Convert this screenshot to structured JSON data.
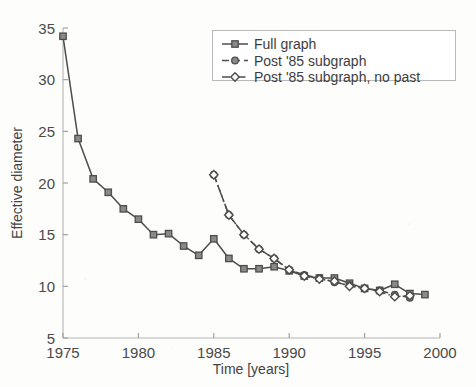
{
  "chart_data": {
    "type": "line",
    "title": "",
    "xlabel": "Time [years]",
    "ylabel": "Effective diameter",
    "xlim": [
      1975,
      2000
    ],
    "ylim": [
      5,
      35
    ],
    "xticks": [
      "1975",
      "1980",
      "1985",
      "1990",
      "1995",
      "2000"
    ],
    "yticks": [
      "5",
      "10",
      "15",
      "20",
      "25",
      "30",
      "35"
    ],
    "grid": false,
    "legend_position": "top-right",
    "series": [
      {
        "name": "Full graph",
        "marker": "square",
        "linestyle": "solid",
        "color": "#4d4d4d",
        "x": [
          1975,
          1976,
          1977,
          1978,
          1979,
          1980,
          1981,
          1982,
          1983,
          1984,
          1985,
          1986,
          1987,
          1988,
          1989,
          1990,
          1991,
          1992,
          1993,
          1994,
          1995,
          1996,
          1997,
          1998,
          1999
        ],
        "y": [
          34.2,
          24.3,
          20.4,
          19.1,
          17.5,
          16.5,
          15.0,
          15.1,
          13.9,
          13.0,
          14.6,
          12.7,
          11.7,
          11.7,
          11.9,
          11.5,
          11.0,
          10.8,
          10.8,
          10.3,
          9.8,
          9.6,
          10.2,
          9.3,
          9.2
        ]
      },
      {
        "name": "Post '85 subgraph",
        "marker": "circle",
        "linestyle": "dashed",
        "color": "#4d4d4d",
        "x": [
          1985,
          1986,
          1987,
          1988,
          1989,
          1990,
          1991,
          1992,
          1993,
          1994,
          1995,
          1996,
          1997,
          1998
        ],
        "y": [
          20.8,
          16.9,
          15.0,
          13.6,
          12.7,
          11.6,
          11.1,
          10.8,
          10.4,
          10.1,
          9.8,
          9.6,
          9.2,
          8.9
        ]
      },
      {
        "name": "Post '85 subgraph, no past",
        "marker": "diamond",
        "linestyle": "dashdot",
        "color": "#4d4d4d",
        "x": [
          1985,
          1986,
          1987,
          1988,
          1989,
          1990,
          1991,
          1992,
          1993,
          1994,
          1995,
          1996,
          1997,
          1998
        ],
        "y": [
          20.8,
          16.9,
          15.0,
          13.6,
          12.7,
          11.6,
          11.0,
          10.7,
          10.5,
          10.0,
          9.8,
          9.5,
          9.0,
          9.1
        ]
      }
    ]
  },
  "legend": {
    "items": [
      {
        "label": "Full graph"
      },
      {
        "label": "Post '85 subgraph"
      },
      {
        "label": "Post '85 subgraph, no past"
      }
    ]
  },
  "colors": {
    "ink": "#4d4d4d",
    "axis": "#9a9a9a",
    "text": "#4a4a4a",
    "background": "#fdfdfb"
  }
}
